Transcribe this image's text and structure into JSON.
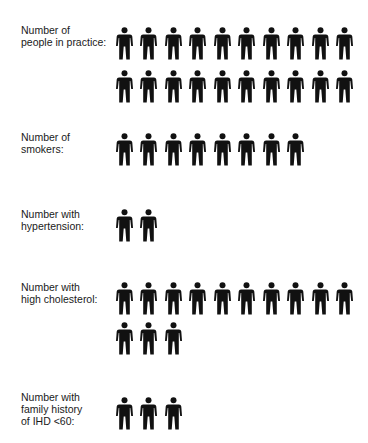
{
  "chart_data": {
    "type": "pictogram",
    "title": "",
    "icon": "person-icon",
    "icon_color": "#111111",
    "categories": [
      "Number of people in practice:",
      "Number of smokers:",
      "Number with hypertension:",
      "Number with high cholesterol:",
      "Number with family history of IHD <60:"
    ],
    "values": [
      20,
      8,
      2,
      13,
      3
    ],
    "icons_per_row": 10
  },
  "rows": [
    {
      "label": "Number of\npeople in practice:",
      "count": 20
    },
    {
      "label": "Number of\nsmokers:",
      "count": 8
    },
    {
      "label": "Number with\nhypertension:",
      "count": 2
    },
    {
      "label": "Number with\nhigh cholesterol:",
      "count": 13
    },
    {
      "label": "Number with\nfamily history\nof IHD <60:",
      "count": 3
    }
  ]
}
